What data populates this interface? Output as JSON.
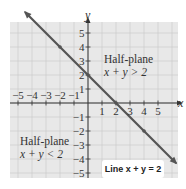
{
  "chart_data": {
    "type": "line",
    "title": "",
    "xlabel": "x",
    "ylabel": "y",
    "xlim": [
      -5.5,
      6
    ],
    "ylim": [
      -5.5,
      6
    ],
    "grid": true,
    "x_ticks": [
      -5,
      -4,
      -3,
      -2,
      -1,
      1,
      2,
      3,
      4,
      5
    ],
    "y_ticks": [
      -5,
      -4,
      -3,
      -2,
      -1,
      1,
      2,
      3,
      4,
      5
    ],
    "series": [
      {
        "name": "Line x + y = 2",
        "equation": "x + y = 2",
        "points": [
          [
            -4.5,
            6.5
          ],
          [
            -2,
            4
          ],
          [
            0,
            2
          ],
          [
            2,
            0
          ],
          [
            4,
            -2
          ],
          [
            6.3,
            -4.3
          ]
        ],
        "color": "#555555",
        "arrows": "both"
      }
    ],
    "regions": [
      {
        "label": "Half-plane",
        "inequality": "x + y > 2",
        "position": "upper-right"
      },
      {
        "label": "Half-plane",
        "inequality": "x + y < 2",
        "position": "lower-left"
      }
    ],
    "annotations": [
      "Half-plane x + y > 2",
      "Half-plane x + y < 2",
      "Line x + y = 2"
    ]
  },
  "labels": {
    "x_axis": "x",
    "y_axis": "y",
    "upper_region_title": "Half-plane",
    "upper_region_ineq": "x + y > 2",
    "lower_region_title": "Half-plane",
    "lower_region_ineq": "x + y < 2",
    "line_label": "Line x + y = 2"
  },
  "colors": {
    "grid_fill": "#e8e8e8",
    "grid_line": "#c8c8c8",
    "axis": "#333333",
    "line": "#555555"
  }
}
